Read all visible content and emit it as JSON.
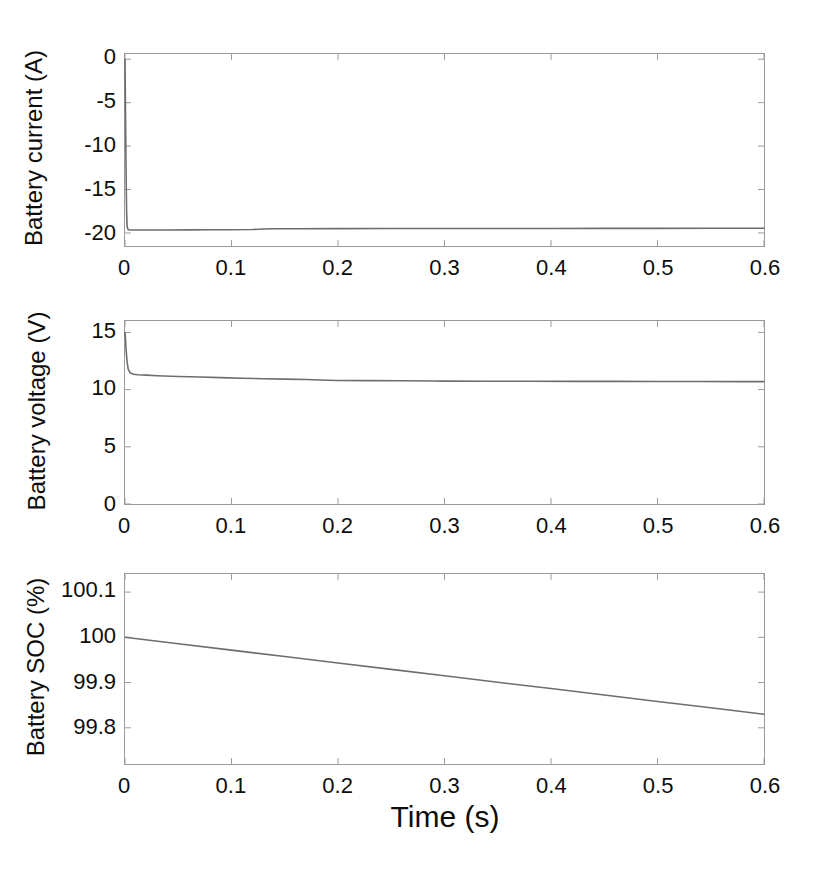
{
  "figure": {
    "background": "#ffffff",
    "line_color": "#6d6d6d",
    "axis_color": "#9a9a9a",
    "text_color": "#0d0d0d",
    "xaxis_title": "Time (s)"
  },
  "chart_data": [
    {
      "type": "line",
      "title": "",
      "xlabel": "Time (s)",
      "ylabel": "Battery current (A)",
      "xlim": [
        0,
        0.6
      ],
      "ylim": [
        -21.5,
        0.6
      ],
      "xticks": [
        0,
        0.1,
        0.2,
        0.3,
        0.4,
        0.5,
        0.6
      ],
      "xticklabels": [
        "0",
        "0.1",
        "0.2",
        "0.3",
        "0.4",
        "0.5",
        "0.6"
      ],
      "yticks": [
        0,
        -5,
        -10,
        -15,
        -20
      ],
      "yticklabels": [
        "0",
        "-5",
        "-10",
        "-15",
        "-20"
      ],
      "grid": false,
      "legend": "none",
      "series": [
        {
          "name": "Battery current",
          "x": [
            0,
            0.0005,
            0.001,
            0.0015,
            0.002,
            0.003,
            0.005,
            0.008,
            0.012,
            0.02,
            0.04,
            0.06,
            0.08,
            0.1,
            0.12,
            0.13,
            0.14,
            0.16,
            0.2,
            0.25,
            0.3,
            0.35,
            0.4,
            0.45,
            0.5,
            0.55,
            0.6
          ],
          "y": [
            0,
            -6.5,
            -13.0,
            -17.5,
            -19.3,
            -19.62,
            -19.65,
            -19.66,
            -19.66,
            -19.66,
            -19.65,
            -19.64,
            -19.63,
            -19.62,
            -19.6,
            -19.55,
            -19.52,
            -19.51,
            -19.5,
            -19.49,
            -19.49,
            -19.48,
            -19.48,
            -19.47,
            -19.47,
            -19.46,
            -19.46
          ]
        }
      ]
    },
    {
      "type": "line",
      "title": "",
      "xlabel": "Time (s)",
      "ylabel": "Battery voltage (V)",
      "xlim": [
        0,
        0.6
      ],
      "ylim": [
        0,
        16
      ],
      "xticks": [
        0,
        0.1,
        0.2,
        0.3,
        0.4,
        0.5,
        0.6
      ],
      "xticklabels": [
        "0",
        "0.1",
        "0.2",
        "0.3",
        "0.4",
        "0.5",
        "0.6"
      ],
      "yticks": [
        0,
        5,
        10,
        15
      ],
      "yticklabels": [
        "0",
        "5",
        "10",
        "15"
      ],
      "grid": false,
      "legend": "none",
      "series": [
        {
          "name": "Battery voltage",
          "x": [
            0,
            0.0005,
            0.001,
            0.002,
            0.003,
            0.005,
            0.008,
            0.012,
            0.02,
            0.03,
            0.05,
            0.07,
            0.09,
            0.11,
            0.13,
            0.15,
            0.17,
            0.19,
            0.2,
            0.23,
            0.26,
            0.29,
            0.3,
            0.34,
            0.38,
            0.42,
            0.46,
            0.5,
            0.54,
            0.58,
            0.6
          ],
          "y": [
            15.0,
            14.4,
            13.5,
            12.4,
            11.8,
            11.45,
            11.35,
            11.3,
            11.27,
            11.22,
            11.15,
            11.1,
            11.05,
            11.0,
            10.95,
            10.92,
            10.88,
            10.82,
            10.8,
            10.79,
            10.78,
            10.75,
            10.74,
            10.73,
            10.73,
            10.72,
            10.72,
            10.71,
            10.71,
            10.7,
            10.7
          ]
        }
      ]
    },
    {
      "type": "line",
      "title": "",
      "xlabel": "Time (s)",
      "ylabel": "Battery SOC (%)",
      "xlim": [
        0,
        0.6
      ],
      "ylim": [
        99.72,
        100.14
      ],
      "xticks": [
        0,
        0.1,
        0.2,
        0.3,
        0.4,
        0.5,
        0.6
      ],
      "xticklabels": [
        "0",
        "0.1",
        "0.2",
        "0.3",
        "0.4",
        "0.5",
        "0.6"
      ],
      "yticks": [
        100.1,
        100,
        99.9,
        99.8
      ],
      "yticklabels": [
        "100.1",
        "100",
        "99.9",
        "99.8"
      ],
      "grid": false,
      "legend": "none",
      "series": [
        {
          "name": "Battery SOC",
          "x": [
            0,
            0.05,
            0.1,
            0.15,
            0.2,
            0.25,
            0.3,
            0.35,
            0.4,
            0.45,
            0.5,
            0.55,
            0.6
          ],
          "y": [
            100.0,
            99.9858,
            99.9717,
            99.9575,
            99.9433,
            99.9292,
            99.915,
            99.9008,
            99.8867,
            99.8725,
            99.8583,
            99.8442,
            99.83
          ]
        }
      ]
    }
  ]
}
